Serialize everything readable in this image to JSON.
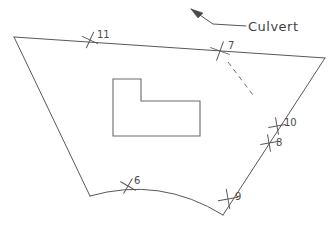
{
  "drawing": {
    "title": "Site boundary survey sketch",
    "background_color": "#ffffff",
    "line_color": "#585858",
    "width": 336,
    "height": 231
  },
  "annotations": [
    {
      "name": "culvert",
      "label": "Culvert",
      "text_x": 248,
      "text_y": 31,
      "leader_path": "M 246 26 L 213 24 L 191 9",
      "arrow_points": "191,9 203,13 198,18",
      "arrow_tip_x": 191,
      "arrow_tip_y": 9
    }
  ],
  "boundary": {
    "name": "parcel-boundary",
    "top_edge_path": "M 14 37 L 325 58",
    "left_edge_path": "M 14 37 L 90 196",
    "right_edge_path": "M 325 58 L 223 215",
    "bottom_curve_path": "M 90 196 Q 160 176 223 215",
    "corners": [
      {
        "label": "top-left",
        "x": 14,
        "y": 37
      },
      {
        "label": "top-right",
        "x": 325,
        "y": 58
      },
      {
        "label": "bottom-left",
        "x": 90,
        "y": 196
      },
      {
        "label": "bottom-right",
        "x": 223,
        "y": 215
      }
    ]
  },
  "building": {
    "name": "building-footprint",
    "shape": "L-shaped",
    "path": "M 113 79 L 141 79 L 141 101 L 200 101 L 200 136 L 113 136 Z"
  },
  "dashed_line": {
    "name": "culvert-run",
    "path": "M 228 62 L 253 95"
  },
  "survey_points": [
    {
      "id": "11",
      "label": "11",
      "cross_x": 90,
      "cross_y": 40,
      "label_x": 97,
      "label_y": 38,
      "rotation": -20
    },
    {
      "id": "7",
      "label": "7",
      "cross_x": 220,
      "cross_y": 51,
      "label_x": 228,
      "label_y": 49,
      "rotation": -25
    },
    {
      "id": "10",
      "label": "10",
      "cross_x": 277,
      "cross_y": 126,
      "label_x": 284,
      "label_y": 126,
      "rotation": -55
    },
    {
      "id": "8",
      "label": "8",
      "cross_x": 269,
      "cross_y": 143,
      "label_x": 276,
      "label_y": 146,
      "rotation": -55
    },
    {
      "id": "9",
      "label": "9",
      "cross_x": 228,
      "cross_y": 199,
      "label_x": 235,
      "label_y": 200,
      "rotation": -55
    },
    {
      "id": "6",
      "label": "6",
      "cross_x": 128,
      "cross_y": 186,
      "label_x": 134,
      "label_y": 184,
      "rotation": -15
    }
  ]
}
